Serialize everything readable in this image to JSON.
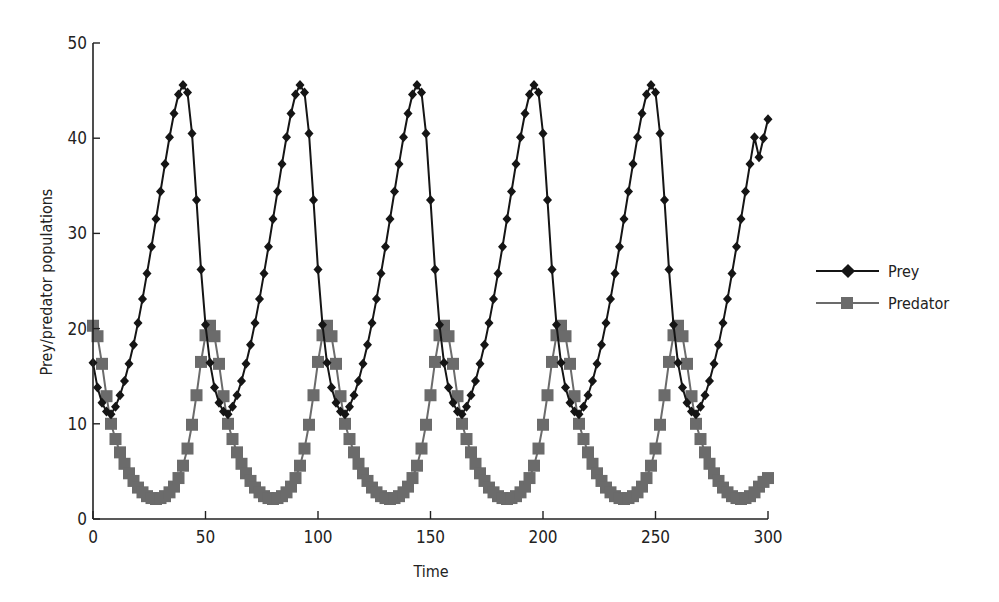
{
  "chart_data": {
    "type": "line",
    "title": "",
    "xlabel": "Time",
    "ylabel": "Prey/predator populations",
    "xlim": [
      0,
      300
    ],
    "ylim": [
      0,
      50
    ],
    "xticks": [
      0,
      50,
      100,
      150,
      200,
      250,
      300
    ],
    "yticks": [
      0,
      10,
      20,
      30,
      40,
      50
    ],
    "grid": false,
    "legend_position": "right",
    "x_step": 2,
    "cycle_prey": [
      11,
      11.8,
      13,
      14.5,
      16.3,
      18.3,
      20.6,
      23.1,
      25.8,
      28.6,
      31.5,
      34.4,
      37.3,
      40.1,
      42.6,
      44.6,
      45.6,
      44.8,
      40.5,
      33.5,
      26.2,
      20.4,
      16.4,
      13.8,
      12.2,
      11.3
    ],
    "cycle_predator": [
      10,
      8.4,
      7,
      5.8,
      4.8,
      4,
      3.3,
      2.8,
      2.4,
      2.2,
      2.1,
      2.2,
      2.4,
      2.8,
      3.4,
      4.3,
      5.6,
      7.4,
      9.9,
      13,
      16.5,
      19.3,
      20.3,
      19.2,
      16.3,
      12.9
    ],
    "cycle_start_index": 22,
    "num_points": 151,
    "end_overrides": {
      "prey": [
        38,
        40,
        42
      ],
      "predator": [
        3.4,
        3.9,
        4.3
      ]
    },
    "series": [
      {
        "name": "Prey",
        "marker": "diamond",
        "color": "#151515",
        "peaks_approx": [
          [
            41,
            45.8
          ],
          [
            93,
            45.5
          ],
          [
            145,
            45.2
          ],
          [
            197,
            45
          ],
          [
            250,
            44.9
          ]
        ],
        "min_approx": 11,
        "start": 16.5,
        "end": 42
      },
      {
        "name": "Predator",
        "marker": "square",
        "color": "#6b6b6b",
        "peaks_approx": [
          [
            51,
            20.3
          ],
          [
            103,
            20.2
          ],
          [
            155,
            20
          ],
          [
            207,
            20
          ],
          [
            259,
            19.8
          ]
        ],
        "min_approx": 2.1,
        "start": 20,
        "end": 4.3
      }
    ]
  }
}
